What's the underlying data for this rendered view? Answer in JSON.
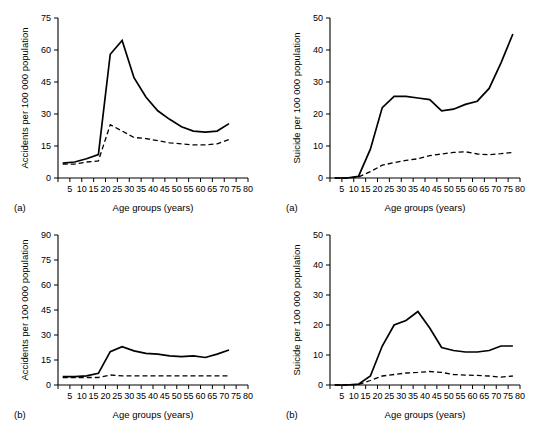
{
  "figure": {
    "width": 551,
    "height": 435,
    "background": "#ffffff"
  },
  "panels": [
    {
      "id": "accidents-a",
      "letter": "(a)",
      "chart_data": {
        "type": "line",
        "title": "",
        "xlabel": "Age groups (years)",
        "ylabel": "Accidents per 100 000 population",
        "xlim": [
          0,
          80
        ],
        "ylim": [
          0,
          75
        ],
        "xticks": [
          0,
          5,
          10,
          15,
          20,
          25,
          30,
          35,
          40,
          45,
          50,
          55,
          60,
          65,
          70,
          75,
          80
        ],
        "xticklabels": [
          "",
          "5",
          "10",
          "15",
          "20",
          "25",
          "30",
          "35",
          "40",
          "45",
          "50",
          "55",
          "60",
          "65",
          "70",
          "75",
          "80"
        ],
        "yticks": [
          0,
          15,
          30,
          45,
          60,
          75
        ],
        "yticklabels": [
          "0",
          "15",
          "30",
          "45",
          "60",
          "75"
        ],
        "grid": false,
        "legend": "none",
        "series": [
          {
            "name": "males",
            "style": "solid",
            "x": [
              2,
              7,
              12,
              17,
              22,
              27,
              32,
              37,
              42,
              47,
              52,
              57,
              62,
              67,
              72
            ],
            "values": [
              7,
              7.5,
              9,
              11,
              58,
              64.5,
              47,
              38,
              31.5,
              27.5,
              24,
              22,
              21.5,
              22,
              25.5
            ]
          },
          {
            "name": "females",
            "style": "dashed",
            "x": [
              2,
              7,
              12,
              17,
              22,
              27,
              32,
              37,
              42,
              47,
              52,
              57,
              62,
              67,
              72
            ],
            "values": [
              6.5,
              6.5,
              7.5,
              8,
              25,
              22,
              19,
              18.5,
              17.5,
              16.5,
              16,
              15.5,
              15.5,
              16,
              18
            ]
          }
        ]
      }
    },
    {
      "id": "suicide-a",
      "letter": "(a)",
      "chart_data": {
        "type": "line",
        "title": "",
        "xlabel": "Age groups (years)",
        "ylabel": "Suicide per 100 000 population",
        "xlim": [
          0,
          80
        ],
        "ylim": [
          0,
          50
        ],
        "xticks": [
          0,
          5,
          10,
          15,
          20,
          25,
          30,
          35,
          40,
          45,
          50,
          55,
          60,
          65,
          70,
          75,
          80
        ],
        "xticklabels": [
          "",
          "5",
          "10",
          "15",
          "20",
          "25",
          "30",
          "35",
          "40",
          "45",
          "50",
          "55",
          "60",
          "65",
          "70",
          "75",
          "80"
        ],
        "yticks": [
          0,
          10,
          20,
          30,
          40,
          50
        ],
        "yticklabels": [
          "0",
          "10",
          "20",
          "30",
          "40",
          "50"
        ],
        "grid": false,
        "legend": "none",
        "series": [
          {
            "name": "males",
            "style": "solid",
            "x": [
              2,
              7,
              12,
              17,
              22,
              27,
              32,
              37,
              42,
              47,
              52,
              57,
              62,
              67,
              72,
              77
            ],
            "values": [
              0,
              0,
              0.5,
              9,
              22,
              25.5,
              25.5,
              25,
              24.5,
              21,
              21.5,
              23,
              24,
              28,
              36,
              45
            ]
          },
          {
            "name": "females",
            "style": "dashed",
            "x": [
              2,
              7,
              12,
              17,
              22,
              27,
              32,
              37,
              42,
              47,
              52,
              57,
              62,
              67,
              72,
              77
            ],
            "values": [
              0,
              0,
              0.3,
              2,
              4,
              4.8,
              5.5,
              6,
              7,
              7.5,
              8,
              8.2,
              7.5,
              7.3,
              7.6,
              8
            ]
          }
        ]
      }
    },
    {
      "id": "accidents-b",
      "letter": "(b)",
      "chart_data": {
        "type": "line",
        "title": "",
        "xlabel": "Age groups (years)",
        "ylabel": "Accidents per 100 000 population",
        "xlim": [
          0,
          80
        ],
        "ylim": [
          0,
          90
        ],
        "xticks": [
          0,
          5,
          10,
          15,
          20,
          25,
          30,
          35,
          40,
          45,
          50,
          55,
          60,
          65,
          70,
          75,
          80
        ],
        "xticklabels": [
          "",
          "5",
          "10",
          "15",
          "20",
          "25",
          "30",
          "35",
          "40",
          "45",
          "50",
          "55",
          "60",
          "65",
          "70",
          "75",
          "80"
        ],
        "yticks": [
          0,
          15,
          30,
          45,
          60,
          75,
          90
        ],
        "yticklabels": [
          "0",
          "15",
          "30",
          "45",
          "60",
          "75",
          "90"
        ],
        "grid": false,
        "legend": "none",
        "series": [
          {
            "name": "males",
            "style": "solid",
            "x": [
              2,
              7,
              12,
              17,
              22,
              27,
              32,
              37,
              42,
              47,
              52,
              57,
              62,
              67,
              72
            ],
            "values": [
              5,
              5,
              5.5,
              7,
              20,
              23,
              20.5,
              19,
              18.5,
              17.5,
              17,
              17.5,
              16.5,
              18.5,
              21
            ]
          },
          {
            "name": "females",
            "style": "dashed",
            "x": [
              2,
              7,
              12,
              17,
              22,
              27,
              32,
              37,
              42,
              47,
              52,
              57,
              62,
              67,
              72
            ],
            "values": [
              4.5,
              4.5,
              4.5,
              4.5,
              6,
              5.5,
              5.5,
              5.5,
              5.5,
              5.5,
              5.5,
              5.5,
              5.5,
              5.5,
              5.5
            ]
          }
        ]
      }
    },
    {
      "id": "suicide-b",
      "letter": "(b)",
      "chart_data": {
        "type": "line",
        "title": "",
        "xlabel": "Age groups (years)",
        "ylabel": "Suicide per 100 000 population",
        "xlim": [
          0,
          80
        ],
        "ylim": [
          0,
          50
        ],
        "xticks": [
          0,
          5,
          10,
          15,
          20,
          25,
          30,
          35,
          40,
          45,
          50,
          55,
          60,
          65,
          70,
          75,
          80
        ],
        "xticklabels": [
          "",
          "5",
          "10",
          "15",
          "20",
          "25",
          "30",
          "35",
          "40",
          "45",
          "50",
          "55",
          "60",
          "65",
          "70",
          "75",
          "80"
        ],
        "yticks": [
          0,
          10,
          20,
          30,
          40,
          50
        ],
        "yticklabels": [
          "0",
          "10",
          "20",
          "30",
          "40",
          "50"
        ],
        "grid": false,
        "legend": "none",
        "series": [
          {
            "name": "males",
            "style": "solid",
            "x": [
              2,
              7,
              12,
              17,
              22,
              27,
              32,
              37,
              42,
              47,
              52,
              57,
              62,
              67,
              72,
              77
            ],
            "values": [
              0,
              0,
              0.3,
              3,
              13,
              20,
              21.5,
              24.5,
              19,
              12.5,
              11.5,
              11,
              11,
              11.5,
              13,
              13
            ]
          },
          {
            "name": "females",
            "style": "dashed",
            "x": [
              2,
              7,
              12,
              17,
              22,
              27,
              32,
              37,
              42,
              47,
              52,
              57,
              62,
              67,
              72,
              77
            ],
            "values": [
              0,
              0,
              0.2,
              1.5,
              3,
              3.5,
              4,
              4.2,
              4.5,
              4.2,
              3.5,
              3.3,
              3.2,
              3,
              2.6,
              3
            ]
          }
        ]
      }
    }
  ]
}
